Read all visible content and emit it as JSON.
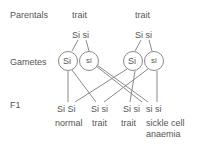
{
  "labels": {
    "parentals": "Parentals",
    "gametes": "Gametes",
    "f1": "F1"
  },
  "parents": [
    {
      "phenotype": "trait",
      "genotype": "Si si"
    },
    {
      "phenotype": "trait",
      "genotype": "Si si"
    }
  ],
  "gametes": [
    "Si",
    "si",
    "Si",
    "si"
  ],
  "offspring": [
    {
      "genotype": "Si Si",
      "phenotype": "normal"
    },
    {
      "genotype": "Si si",
      "phenotype": "trait"
    },
    {
      "genotype": "Si si",
      "phenotype": "trait"
    },
    {
      "genotype": "si si",
      "phenotype_line1": "sickle cell",
      "phenotype_line2": "anaemia"
    }
  ],
  "colors": {
    "line": "#888888",
    "text": "#555555"
  }
}
